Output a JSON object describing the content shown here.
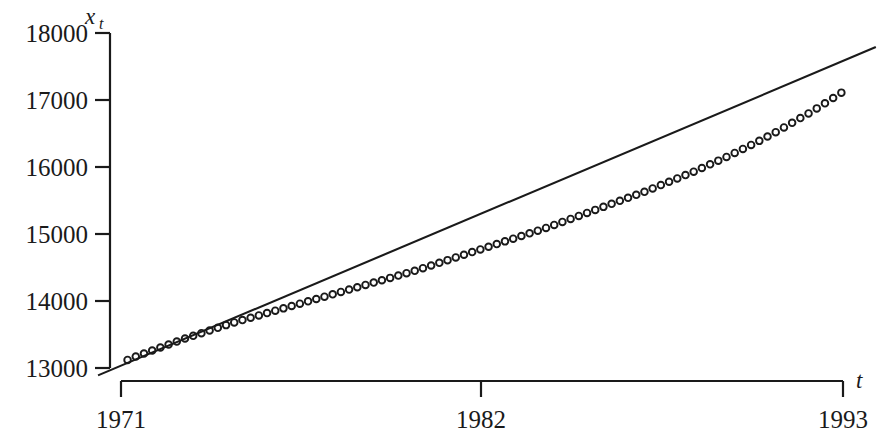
{
  "chart_data": {
    "type": "scatter",
    "title": "",
    "subtitle": "",
    "xlabel": "t",
    "ylabel": "x",
    "ylabel_sub": "t",
    "xlabel_full": "t",
    "ylabel_full": "x_t",
    "grid": false,
    "legend": "none",
    "xlim": [
      1971,
      1993
    ],
    "ylim": [
      13000,
      18000
    ],
    "x_ticks": [
      1971,
      1982,
      1993
    ],
    "x_tick_labels": [
      "1971",
      "1982",
      "1993"
    ],
    "y_ticks": [
      13000,
      14000,
      15000,
      16000,
      17000,
      18000
    ],
    "y_tick_labels": [
      "13000",
      "14000",
      "15000",
      "16000",
      "17000",
      "18000"
    ],
    "marker": "open-circle",
    "series": [
      {
        "name": "observed",
        "type": "scatter",
        "marker": "open-circle",
        "x": [
          1971.2,
          1971.45,
          1971.7,
          1971.95,
          1972.2,
          1972.45,
          1972.7,
          1972.95,
          1973.2,
          1973.45,
          1973.7,
          1973.95,
          1974.2,
          1974.45,
          1974.7,
          1974.95,
          1975.2,
          1975.45,
          1975.7,
          1975.95,
          1976.2,
          1976.45,
          1976.7,
          1976.95,
          1977.2,
          1977.45,
          1977.7,
          1977.95,
          1978.2,
          1978.45,
          1978.7,
          1978.95,
          1979.2,
          1979.45,
          1979.7,
          1979.95,
          1980.2,
          1980.45,
          1980.7,
          1980.95,
          1981.2,
          1981.45,
          1981.7,
          1981.95,
          1982.2,
          1982.45,
          1982.7,
          1982.95,
          1983.2,
          1983.45,
          1983.7,
          1983.95,
          1984.2,
          1984.45,
          1984.7,
          1984.95,
          1985.2,
          1985.45,
          1985.7,
          1985.95,
          1986.2,
          1986.45,
          1986.7,
          1986.95,
          1987.2,
          1987.45,
          1987.7,
          1987.95,
          1988.2,
          1988.45,
          1988.7,
          1988.95,
          1989.2,
          1989.45,
          1989.7,
          1989.95,
          1990.2,
          1990.45,
          1990.7,
          1990.95,
          1991.2,
          1991.45,
          1991.7,
          1991.95,
          1992.2,
          1992.45,
          1992.7,
          1992.95
        ],
        "y": [
          13120,
          13170,
          13215,
          13260,
          13305,
          13350,
          13395,
          13440,
          13480,
          13520,
          13560,
          13600,
          13640,
          13680,
          13715,
          13750,
          13785,
          13820,
          13855,
          13890,
          13925,
          13960,
          13995,
          14030,
          14065,
          14100,
          14135,
          14170,
          14205,
          14240,
          14275,
          14310,
          14345,
          14380,
          14415,
          14450,
          14490,
          14530,
          14570,
          14610,
          14650,
          14690,
          14730,
          14770,
          14810,
          14850,
          14890,
          14930,
          14970,
          15010,
          15050,
          15090,
          15135,
          15180,
          15225,
          15270,
          15315,
          15360,
          15405,
          15450,
          15495,
          15540,
          15585,
          15630,
          15680,
          15730,
          15780,
          15830,
          15880,
          15930,
          15985,
          16040,
          16095,
          16150,
          16210,
          16270,
          16330,
          16390,
          16455,
          16520,
          16590,
          16660,
          16730,
          16800,
          16875,
          16950,
          17030,
          17110
        ]
      },
      {
        "name": "fitted linear trend",
        "type": "line",
        "x": [
          1970.3,
          1994.0
        ],
        "y": [
          12890,
          17790
        ]
      }
    ]
  },
  "axes": {
    "y_axis_title": "x",
    "y_axis_title_sub": "t",
    "x_axis_title": "t"
  }
}
